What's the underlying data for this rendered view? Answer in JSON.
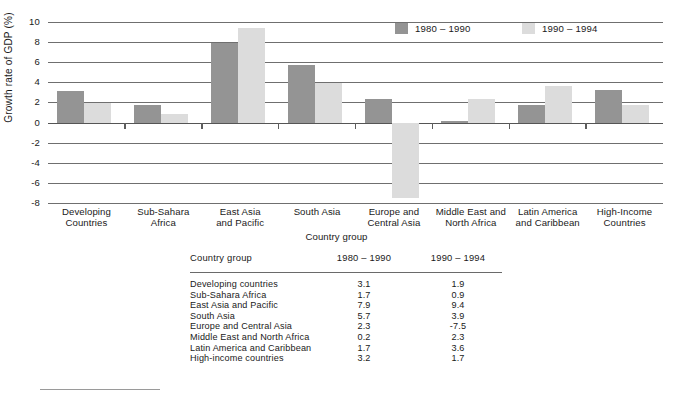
{
  "chart_data": {
    "type": "bar",
    "title": "",
    "xlabel": "Country group",
    "ylabel": "Growth rate of GDP (%)",
    "ylim": [
      -8,
      10
    ],
    "ytick_values": [
      10,
      8,
      6,
      4,
      2,
      0,
      -2,
      -4,
      -6,
      -8
    ],
    "ytick_labels": [
      "10",
      "8",
      "6",
      "4",
      "2",
      "0",
      "-2",
      "-4",
      "-6",
      "-8"
    ],
    "grid": true,
    "legend_position": "top-right",
    "categories": [
      "Developing Countries",
      "Sub-Sahara Africa",
      "East Asia and Pacific",
      "South Asia",
      "Europe and Central Asia",
      "Middle East and North Africa",
      "Latin America and Caribbean",
      "High-Income Countries"
    ],
    "category_lines": [
      [
        "Developing",
        "Countries"
      ],
      [
        "Sub-Sahara",
        "Africa"
      ],
      [
        "East Asia",
        "and Pacific"
      ],
      [
        "South Asia",
        ""
      ],
      [
        "Europe and",
        "Central Asia"
      ],
      [
        "Middle East and",
        "North Africa"
      ],
      [
        "Latin America",
        "and Caribbean"
      ],
      [
        "High-Income",
        "Countries"
      ]
    ],
    "series": [
      {
        "name": "1980 – 1990",
        "color": "#949494",
        "values": [
          3.1,
          1.7,
          7.9,
          5.7,
          2.3,
          0.2,
          1.7,
          3.2
        ]
      },
      {
        "name": "1990 – 1994",
        "color": "#dcdcdc",
        "values": [
          1.9,
          0.9,
          9.4,
          3.9,
          -7.5,
          2.3,
          3.6,
          1.7
        ]
      }
    ]
  },
  "legend": {
    "items": [
      {
        "label": "1980 – 1990",
        "swatch": "dark"
      },
      {
        "label": "1990 – 1994",
        "swatch": "light"
      }
    ]
  },
  "table": {
    "headers": [
      "Country group",
      "1980 – 1990",
      "1990 – 1994"
    ],
    "rows": [
      {
        "group": "Developing  countries",
        "v1": "3.1",
        "v2": "1.9"
      },
      {
        "group": "Sub-Sahara Africa",
        "v1": "1.7",
        "v2": "0.9"
      },
      {
        "group": "East Asia and Pacific",
        "v1": "7.9",
        "v2": "9.4"
      },
      {
        "group": "South Asia",
        "v1": "5.7",
        "v2": "3.9"
      },
      {
        "group": "Europe and Central Asia",
        "v1": "2.3",
        "v2": "-7.5"
      },
      {
        "group": "Middle East and North Africa",
        "v1": "0.2",
        "v2": "2.3"
      },
      {
        "group": "Latin America and Caribbean",
        "v1": "1.7",
        "v2": "3.6"
      },
      {
        "group": "High-income countries",
        "v1": "3.2",
        "v2": "1.7"
      }
    ]
  },
  "colors": {
    "series_1980_1990": "#949494",
    "series_1990_1994": "#dcdcdc",
    "gridline": "#6f6f6f",
    "text": "#1a1a1a"
  }
}
